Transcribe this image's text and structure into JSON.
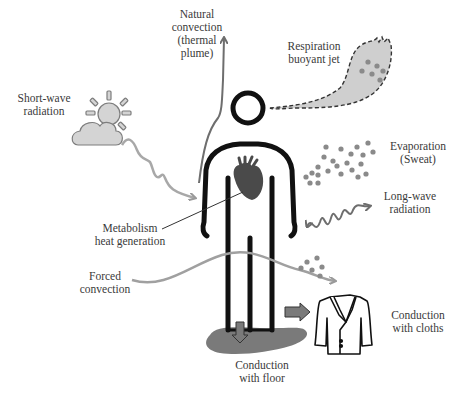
{
  "diagram": {
    "colors": {
      "body_outline": "#111111",
      "heart": "#4a4a4a",
      "gray_arrow": "#9a9a9a",
      "dark_gray": "#6e6e6e",
      "cloud_fill": "#d4d4d4",
      "plume_fill": "#cfcfcf",
      "floor_fill": "#7a7a7a",
      "droplet": "#8a8a8a"
    },
    "labels": {
      "natural_convection": "Natural\nconvection\n(thermal\nplume)",
      "respiration": "Respiration\nbuoyant jet",
      "short_wave": "Short-wave\nradiation",
      "evaporation": "Evaporation\n(Sweat)",
      "long_wave": "Long-wave\nradiation",
      "metabolism": "Metabolism\nheat generation",
      "forced_convection": "Forced\nconvection",
      "conduction_cloths": "Conduction\nwith cloths",
      "conduction_floor": "Conduction\nwith floor"
    },
    "icons": [
      "sun-cloud-icon",
      "heart-icon",
      "jacket-icon",
      "human-body-icon",
      "sweat-droplets-icon",
      "breath-plume-icon",
      "floor-puddle-icon"
    ]
  }
}
